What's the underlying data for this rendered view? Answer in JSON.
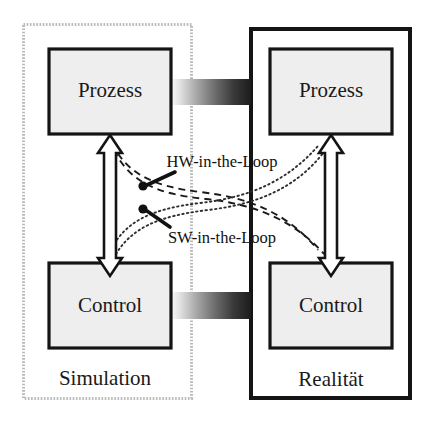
{
  "diagram": {
    "type": "block-diagram",
    "canvas": {
      "width": 433,
      "height": 427
    },
    "colors": {
      "box_fill": "#eeeeee",
      "box_border": "#141414",
      "container_border_solid": "#141414",
      "container_border_dotted": "#b9b9b9",
      "background": "#ffffff",
      "text": "#1a1a1a",
      "gradient_light": "#fbfbfb",
      "gradient_dark": "#1c1c1c",
      "arrow_fill": "#ffffff",
      "arrow_stroke": "#141414",
      "dash_line": "#1a1a1a",
      "dot_line": "#3a3a3a"
    },
    "containers": [
      {
        "id": "simulation",
        "label": "Simulation",
        "border_style": "dotted",
        "label_x": 105,
        "label_y": 380
      },
      {
        "id": "realitaet",
        "label": "Realität",
        "border_style": "solid",
        "label_x": 331,
        "label_y": 381
      }
    ],
    "boxes": [
      {
        "id": "sim-prozess",
        "label": "Prozess",
        "cx": 110,
        "cy": 91
      },
      {
        "id": "real-prozess",
        "label": "Prozess",
        "cx": 330,
        "cy": 91
      },
      {
        "id": "sim-control",
        "label": "Control",
        "cx": 110,
        "cy": 306
      },
      {
        "id": "real-control",
        "label": "Control",
        "cx": 330,
        "cy": 306
      }
    ],
    "connectors": [
      {
        "id": "prozess-link",
        "kind": "gradient-bar",
        "direction": "left-to-right-dark"
      },
      {
        "id": "control-link",
        "kind": "gradient-bar",
        "direction": "left-to-right-dark"
      },
      {
        "id": "sim-vertical-arrow",
        "kind": "double-headed-hollow-arrow",
        "orientation": "vertical"
      },
      {
        "id": "real-vertical-arrow",
        "kind": "double-headed-hollow-arrow",
        "orientation": "vertical"
      }
    ],
    "loops": [
      {
        "id": "hw-in-the-loop",
        "label": "HW-in-the-Loop",
        "line_style": "dashed",
        "label_x": 222,
        "label_y": 163,
        "marker_x": 143,
        "marker_y": 186,
        "leader_from_x": 175,
        "leader_from_y": 172
      },
      {
        "id": "sw-in-the-loop",
        "label": "SW-in-the-Loop",
        "line_style": "dotted",
        "label_x": 222,
        "label_y": 239,
        "marker_x": 143,
        "marker_y": 209,
        "leader_from_x": 170,
        "leader_from_y": 227
      }
    ]
  }
}
